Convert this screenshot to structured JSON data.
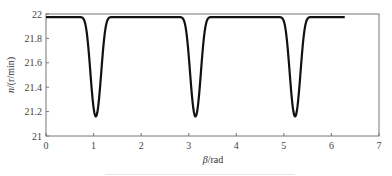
{
  "chart_data": {
    "type": "line",
    "title": "",
    "xlabel": "β/rad",
    "ylabel": "n/(r/min)",
    "xlim": [
      0,
      7
    ],
    "ylim": [
      21,
      22
    ],
    "xticks": [
      0,
      1,
      2,
      3,
      4,
      5,
      6,
      7
    ],
    "yticks": [
      21,
      21.2,
      21.4,
      21.6,
      21.8,
      22
    ],
    "grid": false,
    "legend": null,
    "series": [
      {
        "name": "n",
        "color": "#111111",
        "description": "Periodic rotational speed with three dips over 0..2π",
        "x_range": [
          0,
          6.28
        ],
        "baseline": 21.975,
        "dips": [
          {
            "x": 1.047,
            "min": 21.16
          },
          {
            "x": 3.142,
            "min": 21.16
          },
          {
            "x": 5.236,
            "min": 21.16
          }
        ],
        "sample_points": [
          [
            0,
            21.975
          ],
          [
            0.6,
            21.97
          ],
          [
            0.8,
            21.9
          ],
          [
            0.9,
            21.7
          ],
          [
            1.0,
            21.3
          ],
          [
            1.047,
            21.16
          ],
          [
            1.1,
            21.3
          ],
          [
            1.2,
            21.7
          ],
          [
            1.3,
            21.9
          ],
          [
            1.5,
            21.97
          ],
          [
            2.0,
            21.975
          ],
          [
            2.7,
            21.97
          ],
          [
            2.9,
            21.9
          ],
          [
            3.0,
            21.7
          ],
          [
            3.1,
            21.3
          ],
          [
            3.142,
            21.16
          ],
          [
            3.2,
            21.3
          ],
          [
            3.3,
            21.7
          ],
          [
            3.4,
            21.9
          ],
          [
            3.6,
            21.97
          ],
          [
            4.0,
            21.975
          ],
          [
            4.8,
            21.97
          ],
          [
            5.0,
            21.9
          ],
          [
            5.1,
            21.7
          ],
          [
            5.2,
            21.3
          ],
          [
            5.236,
            21.16
          ],
          [
            5.3,
            21.3
          ],
          [
            5.4,
            21.7
          ],
          [
            5.5,
            21.9
          ],
          [
            5.7,
            21.97
          ],
          [
            6.28,
            21.975
          ]
        ]
      }
    ]
  },
  "axes": {
    "x_tick_labels": [
      "0",
      "1",
      "2",
      "3",
      "4",
      "5",
      "6",
      "7"
    ],
    "y_tick_labels": [
      "21",
      "21.2",
      "21.4",
      "21.6",
      "21.8",
      "22"
    ],
    "xlabel_italic": "β",
    "xlabel_unit": "/rad",
    "ylabel_italic": "n",
    "ylabel_unit": "/(r/min)"
  },
  "style": {
    "line_color": "#111111",
    "axis_color": "#777777",
    "background": "#ffffff"
  }
}
